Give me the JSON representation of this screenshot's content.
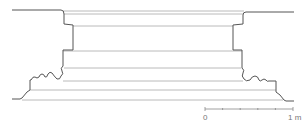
{
  "figure": {
    "type": "architectural-profile",
    "stroke_color": "#555555",
    "inner_line_color": "#a0a0a0"
  },
  "scale_bar": {
    "start_label": "0",
    "end_label": "1 m",
    "ticks": 6,
    "color": "#888888"
  }
}
